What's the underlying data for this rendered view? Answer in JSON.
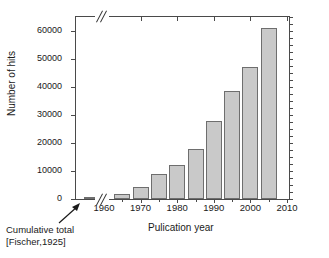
{
  "chart_data": {
    "type": "bar",
    "title": "",
    "xlabel": "Pulication year",
    "ylabel": "Number of hits",
    "xlim": [
      1955,
      2010
    ],
    "ylim": [
      0,
      65000
    ],
    "grid": false,
    "legend": null,
    "axis_break": {
      "axis": "x",
      "note": "//",
      "meaning": "break between cumulative-total bar and 1960"
    },
    "categories": [
      "Cumulative total",
      "1965",
      "1970",
      "1975",
      "1980",
      "1985",
      "1990",
      "1995",
      "2000",
      "2005"
    ],
    "values": [
      500,
      1700,
      4300,
      8800,
      12000,
      18000,
      28000,
      38700,
      47300,
      61000
    ],
    "yticks": [
      0,
      10000,
      20000,
      30000,
      40000,
      50000,
      60000
    ],
    "ytick_labels": [
      "0",
      "10000",
      "20000",
      "30000",
      "40000",
      "50000",
      "60000"
    ],
    "xticks": [
      1960,
      1970,
      1980,
      1990,
      2000,
      2010
    ],
    "xtick_labels": [
      "1960",
      "1970",
      "1980",
      "1990",
      "2000",
      "2010"
    ],
    "annotations": [
      {
        "text_line1": "Cumulative total",
        "text_line2": "[Fischer,1925]",
        "points_to": "Cumulative total"
      }
    ],
    "colors": {
      "bar_fill": "#c9c9c9",
      "bar_edge": "#6e6e6e",
      "axis": "#4a4a4a",
      "text": "#1a1a1a"
    }
  },
  "annotation": {
    "line1": "Cumulative total",
    "line2": "[Fischer,1925]"
  }
}
